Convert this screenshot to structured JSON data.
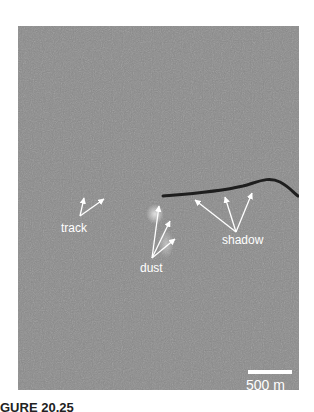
{
  "figure": {
    "labels": {
      "track": "track",
      "dust": "dust",
      "shadow": "shadow"
    },
    "scale_bar": "500 m",
    "caption": "GURE 20.25"
  },
  "colors": {
    "terrain": "#8a8a8a",
    "shadow": "#222222",
    "annotation": "#ffffff"
  }
}
